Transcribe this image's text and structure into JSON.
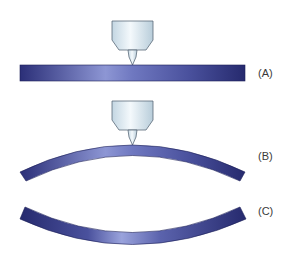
{
  "figure": {
    "panels": [
      {
        "id": "A",
        "label": "(A)",
        "description": "flat beam with indenter tip touching top surface"
      },
      {
        "id": "B",
        "label": "(B)",
        "description": "beam bent upward (convex) with indenter tip touching top"
      },
      {
        "id": "C",
        "label": "(C)",
        "description": "beam bent downward (concave) without indenter"
      }
    ],
    "colors": {
      "beam_dark": "#2b2f78",
      "beam_light": "#9aa3dc",
      "indenter_light": "#eef6fb",
      "indenter_mid": "#c9dbe6",
      "indenter_outline": "#5a6a78",
      "label_text": "#3a3a3a"
    }
  }
}
